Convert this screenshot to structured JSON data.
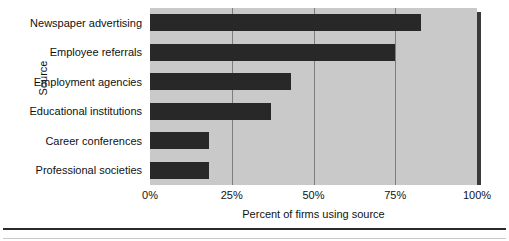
{
  "chart_data": {
    "type": "bar",
    "orientation": "horizontal",
    "title": "",
    "xlabel": "Percent of firms using source",
    "ylabel": "Source",
    "categories": [
      "Newspaper advertising",
      "Employee referrals",
      "Employment agencies",
      "Educational institutions",
      "Career conferences",
      "Professional societies"
    ],
    "values": [
      83,
      75,
      43,
      37,
      18,
      18
    ],
    "xlim": [
      0,
      100
    ],
    "xticks": [
      0,
      25,
      50,
      75,
      100
    ],
    "xtick_labels": [
      "0%",
      "25%",
      "50%",
      "75%",
      "100%"
    ],
    "grid": true,
    "legend": null,
    "colors": {
      "bar": "#282828",
      "plot_background": "#c9c9c9",
      "gridline": "#7d7d7d",
      "text": "#111111",
      "shadow": "#3a3a3a"
    }
  }
}
